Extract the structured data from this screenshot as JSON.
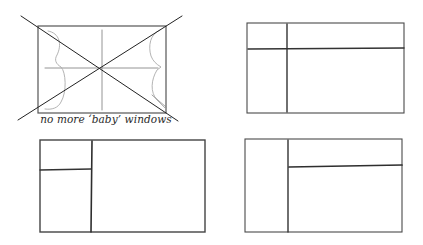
{
  "figure": {
    "caption": "no more ‘baby’ windows",
    "stroke_color": "#3a3a3a",
    "light_stroke_color": "#9a9a9a",
    "background": "#ffffff"
  },
  "sketches": [
    {
      "id": "rejected-layout",
      "crossed_out": true,
      "frame": {
        "x": 38,
        "y": 25,
        "w": 128,
        "h": 88
      },
      "vertical_divider_x": 102,
      "horizontal_divider_y": 68,
      "has_baby_windows": true
    },
    {
      "id": "layout-a",
      "crossed_out": false,
      "frame": {
        "x": 247,
        "y": 23,
        "w": 157,
        "h": 90
      },
      "vertical_divider_x": 287,
      "horizontal_divider_y": 49,
      "horizontal_span": "full-width"
    },
    {
      "id": "layout-b",
      "crossed_out": false,
      "frame": {
        "x": 40,
        "y": 140,
        "w": 165,
        "h": 92
      },
      "vertical_divider_x": 91,
      "horizontal_divider_y": 170,
      "horizontal_span": "left-pane"
    },
    {
      "id": "layout-c",
      "crossed_out": false,
      "frame": {
        "x": 245,
        "y": 139,
        "w": 157,
        "h": 93
      },
      "vertical_divider_x": 288,
      "horizontal_divider_y": 167,
      "horizontal_span": "right-pane"
    }
  ]
}
